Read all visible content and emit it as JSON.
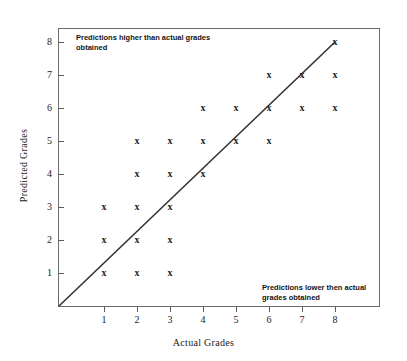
{
  "chart_data": {
    "type": "scatter",
    "title": "",
    "xlabel": "Actual Grades",
    "ylabel": "Predicted Grades",
    "xlim": [
      0,
      8.8
    ],
    "ylim": [
      0,
      8.8
    ],
    "xticks": [
      1,
      2,
      3,
      4,
      5,
      6,
      7,
      8
    ],
    "yticks": [
      1,
      2,
      3,
      4,
      5,
      6,
      7,
      8
    ],
    "grid": false,
    "legend": null,
    "reference_line": {
      "name": "identity-line",
      "description": "y = x perfect prediction line",
      "from": [
        0,
        0
      ],
      "to": [
        8,
        8
      ]
    },
    "marker_symbol": "x",
    "points": [
      {
        "x": 1,
        "y": 1
      },
      {
        "x": 1,
        "y": 2
      },
      {
        "x": 1,
        "y": 3
      },
      {
        "x": 2,
        "y": 1
      },
      {
        "x": 2,
        "y": 2
      },
      {
        "x": 2,
        "y": 3
      },
      {
        "x": 2,
        "y": 4
      },
      {
        "x": 2,
        "y": 5
      },
      {
        "x": 3,
        "y": 1
      },
      {
        "x": 3,
        "y": 2
      },
      {
        "x": 3,
        "y": 3
      },
      {
        "x": 3,
        "y": 4
      },
      {
        "x": 3,
        "y": 5
      },
      {
        "x": 4,
        "y": 4
      },
      {
        "x": 4,
        "y": 5
      },
      {
        "x": 4,
        "y": 6
      },
      {
        "x": 5,
        "y": 5
      },
      {
        "x": 5,
        "y": 6
      },
      {
        "x": 6,
        "y": 5
      },
      {
        "x": 6,
        "y": 6
      },
      {
        "x": 6,
        "y": 7
      },
      {
        "x": 7,
        "y": 6
      },
      {
        "x": 7,
        "y": 7
      },
      {
        "x": 8,
        "y": 6
      },
      {
        "x": 8,
        "y": 7
      },
      {
        "x": 8,
        "y": 8
      }
    ],
    "annotations": [
      {
        "id": "above-line-note",
        "text": "Predictions higher than actual grades obtained",
        "region": "upper-left"
      },
      {
        "id": "below-line-note",
        "text": "Predictions lower then actual grades obtained",
        "region": "lower-right"
      }
    ]
  },
  "colors": {
    "marker": "#242424",
    "line": "#333333",
    "axis": "#6b6b6b",
    "text": "#1a1a1a",
    "background": "#ffffff"
  }
}
